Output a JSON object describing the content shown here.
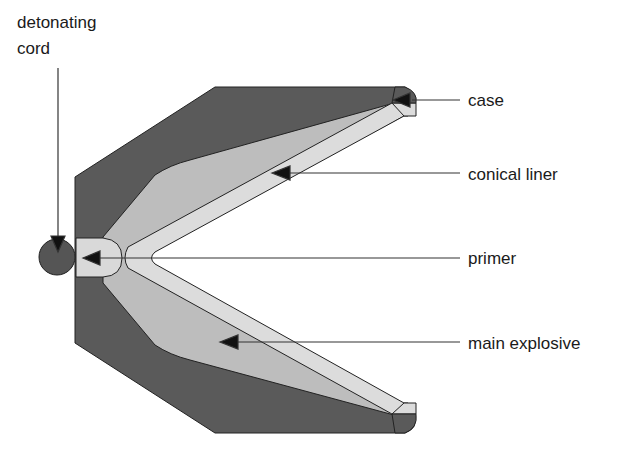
{
  "labels": {
    "detonating_cord_1": "detonating",
    "detonating_cord_2": "cord",
    "case": "case",
    "conical_liner": "conical liner",
    "primer": "primer",
    "main_explosive": "main explosive"
  },
  "colors": {
    "case": "#5a5a5a",
    "explosive": "#bdbdbd",
    "liner": "#dcdcdc",
    "primer": "#d9d9d9",
    "cord": "#555555",
    "outline": "#222222"
  }
}
